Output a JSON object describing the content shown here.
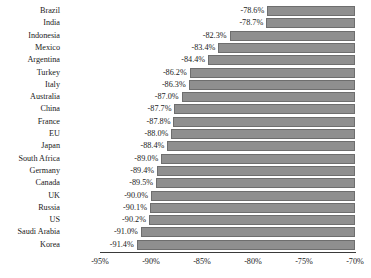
{
  "chart_data": {
    "type": "bar",
    "orientation": "horizontal",
    "title": "",
    "subtitle": "",
    "xlabel": "",
    "ylabel": "",
    "xlim": [
      -95,
      -70
    ],
    "ylim": null,
    "grid": false,
    "legend": null,
    "bar_color": "#8f8f8f",
    "bar_edge_color": "#6e6e6e",
    "axis_color": "#3a3a3a",
    "value_suffix": "%",
    "xticks": [
      -95,
      -90,
      -85,
      -80,
      -75,
      -70
    ],
    "xtick_labels": [
      "-95%",
      "-90%",
      "-85%",
      "-80%",
      "-75%",
      "-70%"
    ],
    "categories": [
      "Brazil",
      "India",
      "Indonesia",
      "Mexico",
      "Argentina",
      "Turkey",
      "Italy",
      "Australia",
      "China",
      "France",
      "EU",
      "Japan",
      "South Africa",
      "Germany",
      "Canada",
      "UK",
      "Russia",
      "US",
      "Saudi Arabia",
      "Korea"
    ],
    "values": [
      -78.6,
      -78.7,
      -82.3,
      -83.4,
      -84.4,
      -86.2,
      -86.3,
      -87.0,
      -87.7,
      -87.8,
      -88.0,
      -88.4,
      -89.0,
      -89.4,
      -89.5,
      -90.0,
      -90.1,
      -90.2,
      -91.0,
      -91.4
    ],
    "data_labels": [
      "-78.6%",
      "-78.7%",
      "-82.3%",
      "-83.4%",
      "-84.4%",
      "-86.2%",
      "-86.3%",
      "-87.0%",
      "-87.7%",
      "-87.8%",
      "-88.0%",
      "-88.4%",
      "-89.0%",
      "-89.4%",
      "-89.5%",
      "-90.0%",
      "-90.1%",
      "-90.2%",
      "-91.0%",
      "-91.4%"
    ]
  }
}
